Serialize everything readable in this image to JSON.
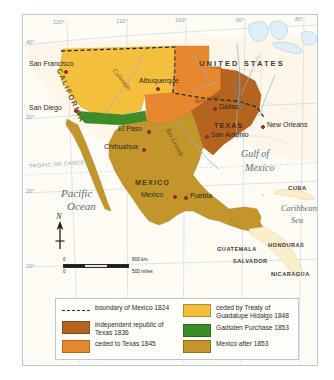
{
  "map": {
    "title": "Mexican Cession and Texas Territorial Changes 1824-1853",
    "background_color": "#fdf9ef",
    "frame_color": "#b9c8d4"
  },
  "graticule": {
    "longitudes": [
      "120°",
      "110°",
      "100°",
      "90°",
      "80°"
    ],
    "latitudes": [
      "40°",
      "30°",
      "20°",
      "10°"
    ],
    "tropic_label": "TROPIC OF CANCER"
  },
  "countries": [
    {
      "name": "UNITED STATES"
    },
    {
      "name": "MEXICO"
    },
    {
      "name": "TEXAS"
    },
    {
      "name": "CALIFORNIA"
    }
  ],
  "central_america": [
    "GUATEMALA",
    "HONDURAS",
    "SALVADOR",
    "NICARAGUA"
  ],
  "islands": [
    "CUBA"
  ],
  "cities": [
    {
      "name": "San Francisco"
    },
    {
      "name": "San Diego"
    },
    {
      "name": "Albuquerque"
    },
    {
      "name": "El Paso"
    },
    {
      "name": "Chihuahua"
    },
    {
      "name": "Dallas"
    },
    {
      "name": "San Antonio"
    },
    {
      "name": "New Orleans"
    },
    {
      "name": "Mexico"
    },
    {
      "name": "Puebla"
    }
  ],
  "water_bodies": [
    {
      "name": "Pacific",
      "name2": "Ocean"
    },
    {
      "name": "Gulf of",
      "name2": "Mexico"
    },
    {
      "name": "Caribbean",
      "name2": "Sea"
    }
  ],
  "rivers": [
    {
      "name": "Colorado"
    },
    {
      "name": "Red River"
    },
    {
      "name": "Rio Grande"
    },
    {
      "name": "Mississippi"
    }
  ],
  "compass": {
    "label": "N"
  },
  "scale": {
    "zero_km": "0",
    "zero_mi": "0",
    "km_label": "800 km",
    "mi_label": "500 miles"
  },
  "legend": {
    "items_left": [
      {
        "label": "boundary of Mexico 1824",
        "swatch": "dashed",
        "color": "#2a2a28"
      },
      {
        "label": "independent republic of Texas 1836",
        "swatch": "solid",
        "color": "#b5641f"
      },
      {
        "label": "ceded to Texas 1845",
        "swatch": "solid",
        "color": "#e8882e"
      }
    ],
    "items_right": [
      {
        "label": "ceded by Treaty of Guadalupe Hidalgo 1848",
        "swatch": "solid",
        "color": "#f3bf3c"
      },
      {
        "label": "Gadsden Purchase 1853",
        "swatch": "solid",
        "color": "#3c8c27"
      },
      {
        "label": "Mexico after 1853",
        "swatch": "solid",
        "color": "#c2962b"
      }
    ]
  }
}
